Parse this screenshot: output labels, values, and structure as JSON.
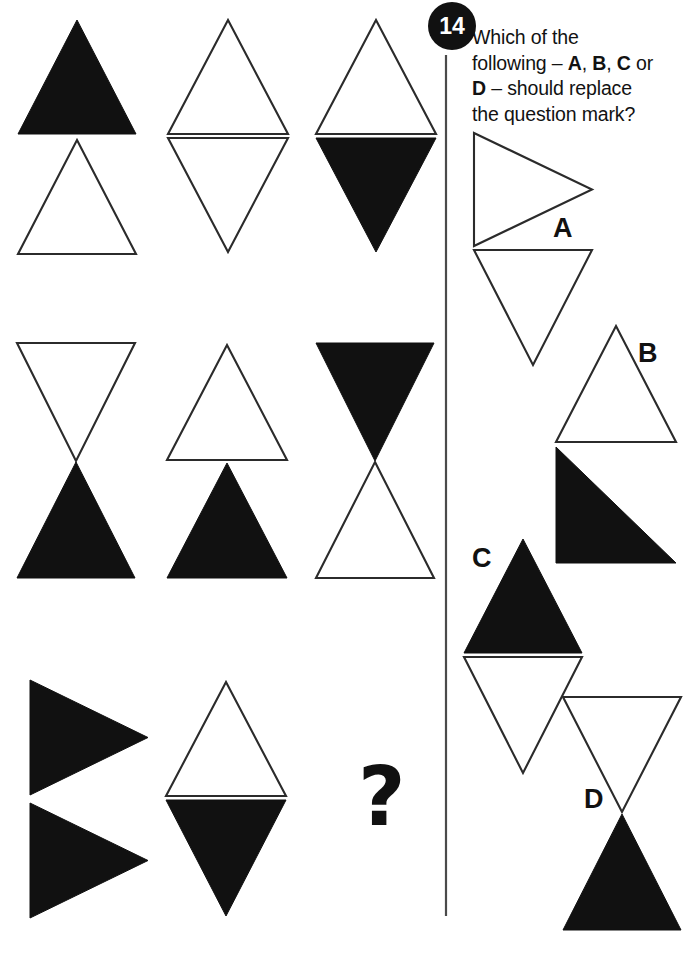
{
  "page": {
    "width": 694,
    "height": 956,
    "background": "#ffffff",
    "ink": "#111111",
    "outline_stroke": "#2b2b2b"
  },
  "question": {
    "number": "14",
    "badge_shape": "circle",
    "badge_bg": "#111111",
    "badge_fg": "#ffffff",
    "prompt_line_1": "Which of the",
    "prompt_line_2_a": "following ",
    "prompt_line_2_b": "– ",
    "prompt_line_2_c": "A",
    "prompt_line_2_d": ", ",
    "prompt_line_2_e": "B",
    "prompt_line_2_f": ", ",
    "prompt_line_2_g": "C",
    "prompt_line_2_h": " or",
    "prompt_line_3_a": "D",
    "prompt_line_3_b": " – should replace",
    "prompt_line_4": "the question mark?",
    "full_prompt": "Which of the following – A, B, C or D – should replace the question mark?",
    "missing_cell_symbol": "?"
  },
  "divider": {
    "orientation": "vertical",
    "x": 446,
    "y1": 55,
    "y2": 916,
    "color": "#4a4a4a"
  },
  "matrix": {
    "rows": 3,
    "columns": 3,
    "cells": [
      {
        "id": "cell-r1c1",
        "row": 1,
        "col": 1,
        "description": "black up-triangle above white up-triangle",
        "shapes": [
          {
            "name": "triangle-up-black",
            "type": "triangle",
            "direction": "up",
            "fill": "black",
            "x": 18,
            "y": 20,
            "w": 118,
            "h": 114
          },
          {
            "name": "triangle-up-white",
            "type": "triangle",
            "direction": "up",
            "fill": "white",
            "x": 18,
            "y": 140,
            "w": 118,
            "h": 114
          }
        ]
      },
      {
        "id": "cell-r1c2",
        "row": 1,
        "col": 2,
        "description": "white up-triangle above white down-triangle",
        "shapes": [
          {
            "name": "triangle-up-white",
            "type": "triangle",
            "direction": "up",
            "fill": "white",
            "x": 168,
            "y": 20,
            "w": 120,
            "h": 114
          },
          {
            "name": "triangle-down-white",
            "type": "triangle",
            "direction": "down",
            "fill": "white",
            "x": 168,
            "y": 138,
            "w": 120,
            "h": 114
          }
        ]
      },
      {
        "id": "cell-r1c3",
        "row": 1,
        "col": 3,
        "description": "white up-triangle above black down-triangle",
        "shapes": [
          {
            "name": "triangle-up-white",
            "type": "triangle",
            "direction": "up",
            "fill": "white",
            "x": 316,
            "y": 20,
            "w": 120,
            "h": 114
          },
          {
            "name": "triangle-down-black",
            "type": "triangle",
            "direction": "down",
            "fill": "black",
            "x": 316,
            "y": 138,
            "w": 120,
            "h": 114
          }
        ]
      },
      {
        "id": "cell-r2c1",
        "row": 2,
        "col": 1,
        "description": "white down-triangle above black up-triangle forming bowtie",
        "shapes": [
          {
            "name": "triangle-down-white",
            "type": "triangle",
            "direction": "down",
            "fill": "white",
            "x": 17,
            "y": 343,
            "w": 118,
            "h": 118
          },
          {
            "name": "triangle-up-black",
            "type": "triangle",
            "direction": "up",
            "fill": "black",
            "x": 17,
            "y": 462,
            "w": 118,
            "h": 116
          }
        ]
      },
      {
        "id": "cell-r2c2",
        "row": 2,
        "col": 2,
        "description": "white up-triangle above black up-triangle",
        "shapes": [
          {
            "name": "triangle-up-white",
            "type": "triangle",
            "direction": "up",
            "fill": "white",
            "x": 167,
            "y": 345,
            "w": 120,
            "h": 115
          },
          {
            "name": "triangle-up-black",
            "type": "triangle",
            "direction": "up",
            "fill": "black",
            "x": 167,
            "y": 463,
            "w": 120,
            "h": 115
          }
        ]
      },
      {
        "id": "cell-r2c3",
        "row": 2,
        "col": 3,
        "description": "black down-triangle above white up-triangle forming bowtie",
        "shapes": [
          {
            "name": "triangle-down-black",
            "type": "triangle",
            "direction": "down",
            "fill": "black",
            "x": 316,
            "y": 343,
            "w": 118,
            "h": 118
          },
          {
            "name": "triangle-up-white",
            "type": "triangle",
            "direction": "up",
            "fill": "white",
            "x": 316,
            "y": 462,
            "w": 118,
            "h": 116
          }
        ]
      },
      {
        "id": "cell-r3c1",
        "row": 3,
        "col": 1,
        "description": "two black right-pointing triangles stacked",
        "shapes": [
          {
            "name": "triangle-right-black",
            "type": "triangle",
            "direction": "right",
            "fill": "black",
            "x": 30,
            "y": 680,
            "w": 118,
            "h": 115
          },
          {
            "name": "triangle-right-black",
            "type": "triangle",
            "direction": "right",
            "fill": "black",
            "x": 30,
            "y": 803,
            "w": 118,
            "h": 115
          }
        ]
      },
      {
        "id": "cell-r3c2",
        "row": 3,
        "col": 2,
        "description": "white up-triangle above black down-triangle",
        "shapes": [
          {
            "name": "triangle-up-white",
            "type": "triangle",
            "direction": "up",
            "fill": "white",
            "x": 166,
            "y": 682,
            "w": 120,
            "h": 114
          },
          {
            "name": "triangle-down-black",
            "type": "triangle",
            "direction": "down",
            "fill": "black",
            "x": 166,
            "y": 800,
            "w": 120,
            "h": 116
          }
        ]
      },
      {
        "id": "cell-r3c3",
        "row": 3,
        "col": 3,
        "description": "missing cell marked with question mark",
        "is_question": true,
        "label_x": 358,
        "label_y": 825,
        "shapes": []
      }
    ]
  },
  "options": [
    {
      "id": "option-a",
      "letter": "A",
      "label_x": 553,
      "label_y": 237,
      "description": "white right-pointing triangle above white down-triangle",
      "shapes": [
        {
          "name": "triangle-right-white",
          "type": "triangle",
          "direction": "right",
          "fill": "white",
          "x": 474,
          "y": 133,
          "w": 118,
          "h": 113
        },
        {
          "name": "triangle-down-white",
          "type": "triangle",
          "direction": "down",
          "fill": "white",
          "x": 474,
          "y": 250,
          "w": 118,
          "h": 115
        }
      ]
    },
    {
      "id": "option-b",
      "letter": "B",
      "label_x": 638,
      "label_y": 362,
      "description": "white up-triangle above black right-triangle",
      "shapes": [
        {
          "name": "triangle-up-white",
          "type": "triangle",
          "direction": "up",
          "fill": "white",
          "x": 556,
          "y": 326,
          "w": 120,
          "h": 116
        },
        {
          "name": "triangle-right-angle-black",
          "type": "triangle",
          "direction": "right-angle-bottom-right",
          "fill": "black",
          "x": 556,
          "y": 447,
          "w": 120,
          "h": 116
        }
      ]
    },
    {
      "id": "option-c",
      "letter": "C",
      "label_x": 472,
      "label_y": 567,
      "description": "black up-triangle above white down-triangle",
      "shapes": [
        {
          "name": "triangle-up-black",
          "type": "triangle",
          "direction": "up",
          "fill": "black",
          "x": 464,
          "y": 539,
          "w": 118,
          "h": 114
        },
        {
          "name": "triangle-down-white",
          "type": "triangle",
          "direction": "down",
          "fill": "white",
          "x": 464,
          "y": 657,
          "w": 118,
          "h": 116
        }
      ]
    },
    {
      "id": "option-d",
      "letter": "D",
      "label_x": 584,
      "label_y": 808,
      "description": "white down-triangle above black up-triangle forming bowtie",
      "shapes": [
        {
          "name": "triangle-down-white",
          "type": "triangle",
          "direction": "down",
          "fill": "white",
          "x": 563,
          "y": 697,
          "w": 118,
          "h": 115
        },
        {
          "name": "triangle-up-black",
          "type": "triangle",
          "direction": "up",
          "fill": "black",
          "x": 563,
          "y": 814,
          "w": 118,
          "h": 116
        }
      ]
    }
  ]
}
